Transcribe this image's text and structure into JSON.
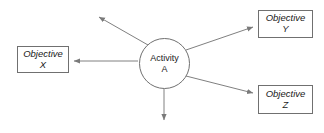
{
  "diagram": {
    "background_color": "#ffffff",
    "line_color": "#808080",
    "border_color": "#707070",
    "text_color": "#1a1a1a",
    "center_node": {
      "shape": "circle",
      "label_line1": "Activity",
      "label_line2": "A"
    },
    "nodes": [
      {
        "id": "objective-x",
        "shape": "rectangle",
        "label_line1": "Objective",
        "label_line2": "X",
        "position": "left"
      },
      {
        "id": "objective-y",
        "shape": "rectangle",
        "label_line1": "Objective",
        "label_line2": "Y",
        "position": "top-right"
      },
      {
        "id": "objective-z",
        "shape": "rectangle",
        "label_line1": "Objective",
        "label_line2": "Z",
        "position": "bottom-right"
      }
    ],
    "arrows": [
      {
        "id": "arrow-to-objective-x",
        "from": "activity-a",
        "to": "objective-x",
        "direction": "left"
      },
      {
        "id": "arrow-to-objective-y",
        "from": "activity-a",
        "to": "objective-y",
        "direction": "up-right"
      },
      {
        "id": "arrow-to-objective-z",
        "from": "activity-a",
        "to": "objective-z",
        "direction": "down-right"
      },
      {
        "id": "arrow-dangling-up-left",
        "from": "activity-a",
        "to": null,
        "direction": "up-left"
      },
      {
        "id": "arrow-dangling-down",
        "from": "activity-a",
        "to": null,
        "direction": "down"
      }
    ]
  }
}
